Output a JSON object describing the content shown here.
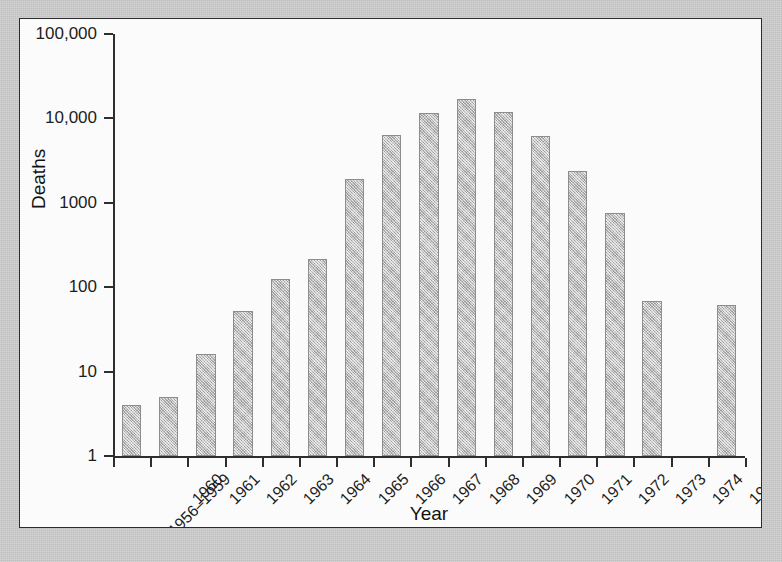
{
  "chart_data": {
    "type": "bar",
    "title": "",
    "xlabel": "Year",
    "ylabel": "Deaths",
    "yscale": "log",
    "ylim": [
      1,
      100000
    ],
    "ytick_labels": [
      "100,000",
      "10,000",
      "1000",
      "100",
      "10",
      "1"
    ],
    "ytick_values": [
      100000,
      10000,
      1000,
      100,
      10,
      1
    ],
    "grid": false,
    "legend": null,
    "categories": [
      "1956–1959",
      "1960",
      "1961",
      "1962",
      "1963",
      "1964",
      "1965",
      "1966",
      "1967",
      "1968",
      "1969",
      "1970",
      "1971",
      "1972",
      "1973",
      "1974",
      "1975"
    ],
    "values": [
      4,
      5,
      16,
      52,
      125,
      215,
      1900,
      6300,
      11500,
      17000,
      12000,
      6200,
      2400,
      760,
      68,
      0,
      62
    ],
    "bar_color": "#bcbcbc",
    "bar_edge_color": "#8d8d8d",
    "axis_color": "#2e2e2e",
    "panel_background": "#fbfbfb",
    "mat_background": "#c9c9c9"
  }
}
